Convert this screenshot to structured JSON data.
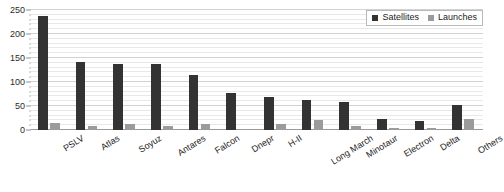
{
  "chart_data": {
    "type": "bar",
    "title": "",
    "xlabel": "",
    "ylabel": "",
    "ylim": [
      0,
      250
    ],
    "yticks": [
      0,
      50,
      100,
      150,
      200,
      250
    ],
    "grid": true,
    "legend_position": "top-right",
    "categories": [
      "PSLV",
      "Atlas",
      "Soyuz",
      "Antares",
      "Falcon",
      "Dnepr",
      "H-II",
      "Long March",
      "Minotaur",
      "Electron",
      "Delta",
      "Others"
    ],
    "series": [
      {
        "name": "Satellites",
        "color": "#333333",
        "values": [
          237,
          141,
          138,
          137,
          115,
          78,
          68,
          63,
          58,
          22,
          18,
          52
        ]
      },
      {
        "name": "Launches",
        "color": "#9b9b9b",
        "values": [
          14,
          8,
          13,
          8,
          13,
          3,
          13,
          20,
          9,
          5,
          5,
          22
        ]
      }
    ]
  },
  "legend": {
    "items": [
      {
        "label": "Satellites",
        "swatch": "satellites"
      },
      {
        "label": "Launches",
        "swatch": "launches"
      }
    ]
  },
  "colors": {
    "satellites": "#333333",
    "launches": "#9b9b9b",
    "gridline": "#e8e8e8",
    "gridline_major": "#d2d2d2",
    "axis": "#9a9a9a",
    "text": "#1d1d1d",
    "background": "#ffffff"
  }
}
